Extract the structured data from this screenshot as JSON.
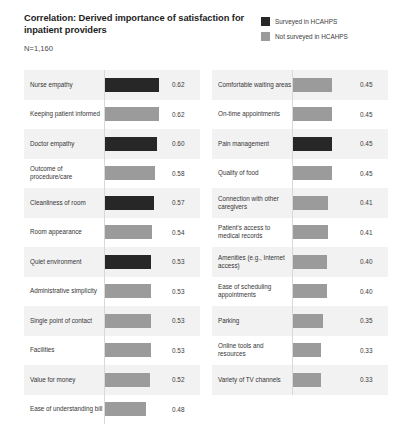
{
  "header": {
    "title": "Correlation: Derived importance of satisfaction for inpatient providers",
    "subtitle": "N=1,160"
  },
  "legend": {
    "items": [
      {
        "label": "Surveyed in HCAHPS",
        "color": "#272727",
        "key": "surveyed"
      },
      {
        "label": "Not surveyed in HCAHPS",
        "color": "#9b9b9b",
        "key": "not_surveyed"
      }
    ]
  },
  "colors": {
    "surveyed": "#272727",
    "not_surveyed": "#9b9b9b",
    "band": "#f2f2f2",
    "plain": "#ffffff",
    "baseline": "#d8d8d8"
  },
  "chart_data": {
    "type": "bar",
    "title": "Correlation: Derived importance of satisfaction for inpatient providers",
    "subtitle": "N=1,160",
    "xlabel": "",
    "ylabel": "",
    "xlim": [
      0,
      0.7
    ],
    "grid": false,
    "orientation": "horizontal",
    "legend_position": "top-right",
    "legend": [
      "Surveyed in HCAHPS",
      "Not surveyed in HCAHPS"
    ],
    "columns": [
      {
        "name": "left",
        "categories": [
          "Nurse empathy",
          "Keeping patient informed",
          "Doctor empathy",
          "Outcome of procedure/care",
          "Cleanliness of room",
          "Room appearance",
          "Quiet environment",
          "Administrative simplicity",
          "Single point of contact",
          "Facilities",
          "Value for money",
          "Ease of understanding bill"
        ],
        "values": [
          0.62,
          0.62,
          0.6,
          0.58,
          0.57,
          0.54,
          0.53,
          0.53,
          0.53,
          0.53,
          0.52,
          0.48
        ],
        "value_labels": [
          "0.62",
          "0.62",
          "0.60",
          "0.58",
          "0.57",
          "0.54",
          "0.53",
          "0.53",
          "0.53",
          "0.53",
          "0.52",
          "0.48"
        ],
        "series_of": [
          "surveyed",
          "not_surveyed",
          "surveyed",
          "not_surveyed",
          "surveyed",
          "not_surveyed",
          "surveyed",
          "not_surveyed",
          "not_surveyed",
          "not_surveyed",
          "not_surveyed",
          "not_surveyed"
        ]
      },
      {
        "name": "right",
        "categories": [
          "Comfortable waiting areas",
          "On-time appointments",
          "Pain management",
          "Quality of food",
          "Connection with other caregivers",
          "Patient's access to medical records",
          "Amenities (e.g., Internet access)",
          "Ease of scheduling appointments",
          "Parking",
          "Online tools and resources",
          "Variety of TV channels"
        ],
        "values": [
          0.45,
          0.45,
          0.45,
          0.45,
          0.41,
          0.41,
          0.4,
          0.4,
          0.35,
          0.33,
          0.33
        ],
        "value_labels": [
          "0.45",
          "0.45",
          "0.45",
          "0.45",
          "0.41",
          "0.41",
          "0.40",
          "0.40",
          "0.35",
          "0.33",
          "0.33"
        ],
        "series_of": [
          "not_surveyed",
          "not_surveyed",
          "surveyed",
          "not_surveyed",
          "not_surveyed",
          "not_surveyed",
          "not_surveyed",
          "not_surveyed",
          "not_surveyed",
          "not_surveyed",
          "not_surveyed"
        ]
      }
    ]
  }
}
